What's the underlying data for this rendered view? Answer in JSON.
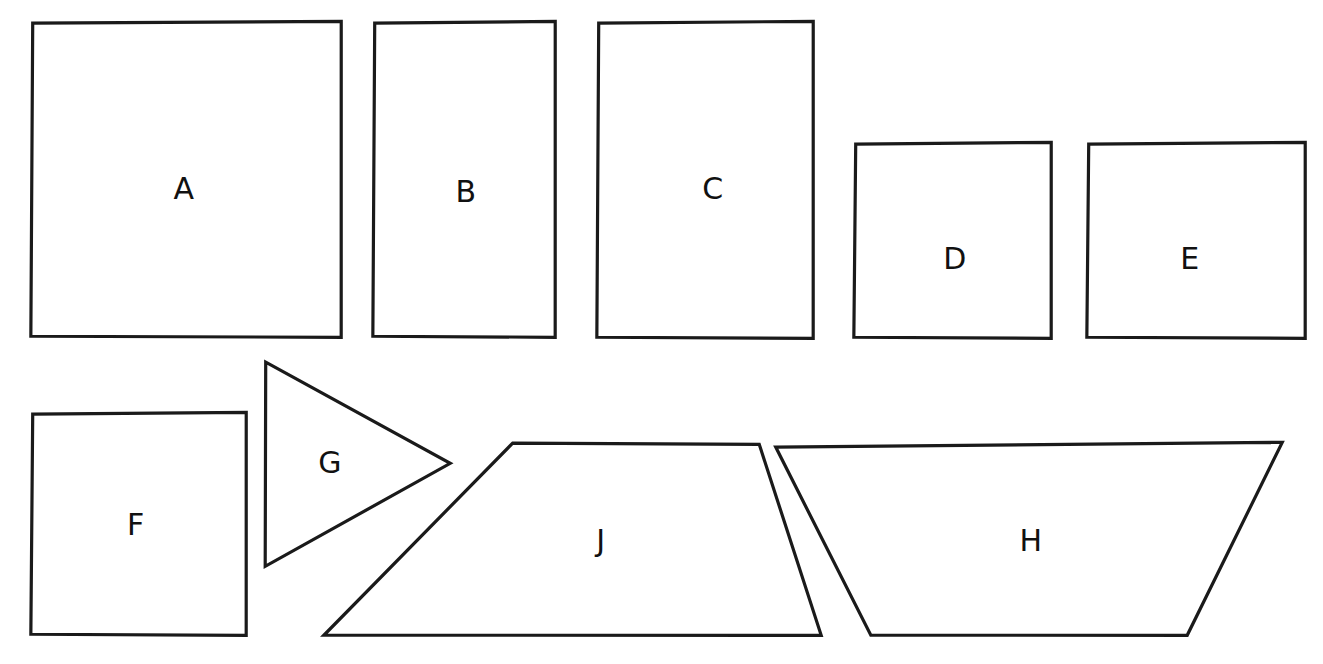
{
  "document": {
    "title": "Hand-drawn geometric shapes worksheet",
    "background_color": "#ffffff",
    "stroke_color": "#1a1a1a",
    "label_color": "#111111",
    "width": 1323,
    "height": 664
  },
  "shapes": [
    {
      "id": "shape-a",
      "label": "A",
      "kind": "rectangle",
      "points": "32,22 342,22 342,337 32,337",
      "label_x": 184,
      "label_y": 190
    },
    {
      "id": "shape-b",
      "label": "B",
      "kind": "rectangle",
      "points": "374,22 556,22 556,337 374,337",
      "label_x": 466,
      "label_y": 193
    },
    {
      "id": "shape-c",
      "label": "C",
      "kind": "rectangle",
      "points": "598,22 814,22 814,338 598,338",
      "label_x": 713,
      "label_y": 190
    },
    {
      "id": "shape-d",
      "label": "D",
      "kind": "rectangle",
      "points": "855,143 1052,143 1052,338 855,338",
      "label_x": 955,
      "label_y": 260
    },
    {
      "id": "shape-e",
      "label": "E",
      "kind": "rectangle",
      "points": "1088,143 1306,143 1306,338 1088,338",
      "label_x": 1190,
      "label_y": 260
    },
    {
      "id": "shape-f",
      "label": "F",
      "kind": "rectangle",
      "points": "32,413 247,413 247,635 32,635",
      "label_x": 136,
      "label_y": 526
    },
    {
      "id": "shape-g",
      "label": "G",
      "kind": "triangle",
      "points": "265,361 451,464 266,566",
      "label_x": 330,
      "label_y": 464
    },
    {
      "id": "shape-j",
      "label": "J",
      "kind": "trapezoid",
      "points": "512,442 760,445 822,635 325,636",
      "label_x": 601,
      "label_y": 542
    },
    {
      "id": "shape-h",
      "label": "H",
      "kind": "trapezoid",
      "points": "775,446 1283,443 1188,635 872,636",
      "label_x": 1031,
      "label_y": 542
    }
  ]
}
